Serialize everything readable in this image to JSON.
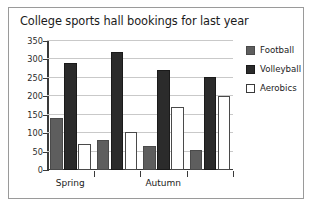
{
  "chart_data": {
    "type": "bar",
    "title": "College sports hall bookings for last year",
    "xlabel": "",
    "ylabel": "",
    "ylim": [
      0,
      350
    ],
    "yticks": [
      0,
      50,
      100,
      150,
      200,
      250,
      300,
      350
    ],
    "ytick_labels": [
      "0",
      "50",
      "100",
      "150",
      "200",
      "250",
      "300",
      "350"
    ],
    "grid": true,
    "legend_position": "right",
    "categories": [
      "Spring",
      "",
      "Autumn",
      ""
    ],
    "tick_labels_visible": [
      "Spring",
      "Autumn"
    ],
    "series": [
      {
        "name": "Football",
        "color": "#5e5e5e",
        "values": [
          140,
          82,
          64,
          54
        ]
      },
      {
        "name": "Volleyball",
        "color": "#2b2b2b",
        "values": [
          290,
          320,
          272,
          252
        ]
      },
      {
        "name": "Aerobics",
        "color": "#ffffff",
        "values": [
          70,
          102,
          172,
          202
        ]
      }
    ]
  },
  "legend": {
    "items": [
      {
        "label": "Football"
      },
      {
        "label": "Volleyball"
      },
      {
        "label": "Aerobics"
      }
    ]
  },
  "axis": {
    "y_labels": [
      "350",
      "300",
      "250",
      "200",
      "150",
      "100",
      "50",
      "0"
    ],
    "x_labels": [
      "Spring",
      "Autumn"
    ]
  }
}
